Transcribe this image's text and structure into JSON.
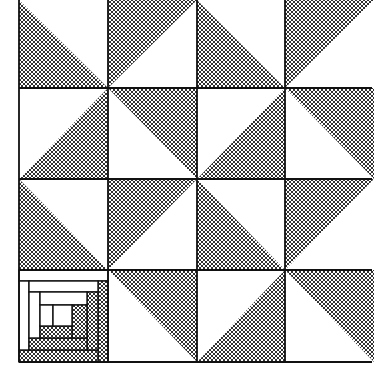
{
  "figure": {
    "colors": {
      "background": "#ffffff",
      "line": "#111111",
      "hatch": "#1a1a1a"
    },
    "grid": {
      "cols_x": [
        19,
        108,
        197,
        285,
        374
      ],
      "rows_y": [
        0,
        88,
        179,
        270,
        362
      ]
    },
    "cells": [
      {
        "row": 0,
        "col": 0,
        "type": "triangle",
        "hatched": "lower-left"
      },
      {
        "row": 0,
        "col": 1,
        "type": "triangle",
        "hatched": "upper-left"
      },
      {
        "row": 0,
        "col": 2,
        "type": "triangle",
        "hatched": "lower-left"
      },
      {
        "row": 0,
        "col": 3,
        "type": "triangle",
        "hatched": "upper-left"
      },
      {
        "row": 1,
        "col": 0,
        "type": "triangle",
        "hatched": "lower-right"
      },
      {
        "row": 1,
        "col": 1,
        "type": "triangle",
        "hatched": "upper-right"
      },
      {
        "row": 1,
        "col": 2,
        "type": "triangle",
        "hatched": "lower-right"
      },
      {
        "row": 1,
        "col": 3,
        "type": "triangle",
        "hatched": "upper-right"
      },
      {
        "row": 2,
        "col": 0,
        "type": "triangle",
        "hatched": "lower-left"
      },
      {
        "row": 2,
        "col": 1,
        "type": "triangle",
        "hatched": "upper-left"
      },
      {
        "row": 2,
        "col": 2,
        "type": "triangle",
        "hatched": "lower-left"
      },
      {
        "row": 2,
        "col": 3,
        "type": "triangle",
        "hatched": "upper-left"
      },
      {
        "row": 3,
        "col": 0,
        "type": "log-cabin"
      },
      {
        "row": 3,
        "col": 1,
        "type": "triangle",
        "hatched": "upper-right"
      },
      {
        "row": 3,
        "col": 2,
        "type": "triangle",
        "hatched": "lower-right"
      },
      {
        "row": 3,
        "col": 3,
        "type": "triangle",
        "hatched": "upper-right"
      }
    ],
    "log_cabin": {
      "logs": [
        {
          "x": 19,
          "y": 270,
          "w": 89,
          "h": 11,
          "fill": "white"
        },
        {
          "x": 98,
          "y": 281,
          "w": 10,
          "h": 81,
          "fill": "hatch"
        },
        {
          "x": 19,
          "y": 350,
          "w": 79,
          "h": 12,
          "fill": "hatch"
        },
        {
          "x": 19,
          "y": 281,
          "w": 10,
          "h": 69,
          "fill": "white"
        },
        {
          "x": 29,
          "y": 281,
          "w": 69,
          "h": 11,
          "fill": "white"
        },
        {
          "x": 87,
          "y": 292,
          "w": 11,
          "h": 58,
          "fill": "hatch"
        },
        {
          "x": 29,
          "y": 338,
          "w": 58,
          "h": 12,
          "fill": "hatch"
        },
        {
          "x": 29,
          "y": 292,
          "w": 11,
          "h": 46,
          "fill": "white"
        },
        {
          "x": 40,
          "y": 292,
          "w": 47,
          "h": 13,
          "fill": "white"
        },
        {
          "x": 72,
          "y": 305,
          "w": 15,
          "h": 33,
          "fill": "hatch"
        },
        {
          "x": 40,
          "y": 326,
          "w": 32,
          "h": 12,
          "fill": "hatch"
        },
        {
          "x": 40,
          "y": 305,
          "w": 13,
          "h": 21,
          "fill": "white"
        },
        {
          "x": 53,
          "y": 305,
          "w": 19,
          "h": 21,
          "fill": "white"
        }
      ]
    }
  }
}
